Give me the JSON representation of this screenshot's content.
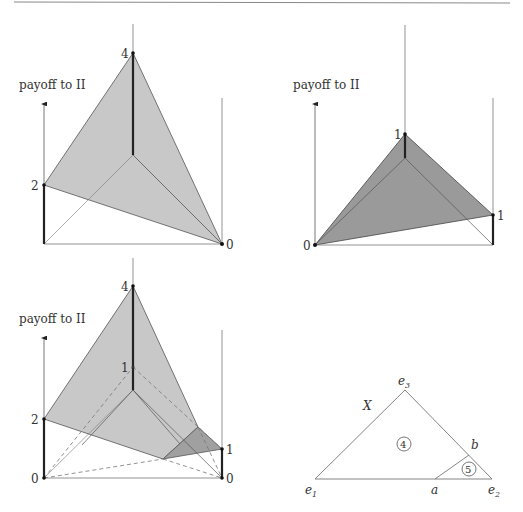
{
  "header_rule": true,
  "panels": [
    {
      "id": "top-left",
      "axis_label": "payoff to II",
      "ticks": {
        "center_top": "4",
        "left": "2",
        "right": "0"
      },
      "fill": "#c8c8c8"
    },
    {
      "id": "top-right",
      "axis_label": "payoff to II",
      "ticks": {
        "center_top": "1",
        "left": "0",
        "right": "1"
      },
      "fill": "#9a9a9a"
    },
    {
      "id": "bottom-left",
      "axis_label": "payoff to II",
      "ticks": {
        "center_top": "4",
        "center_mid": "1",
        "left_top": "2",
        "left_bottom": "0",
        "right_top": "1",
        "right_bottom": "0"
      },
      "fill_light": "#c8c8c8",
      "fill_dark": "#a0a0a0"
    },
    {
      "id": "bottom-right-simplex",
      "vertex_labels": {
        "e1": "e",
        "e1_sub": "1",
        "e2": "e",
        "e2_sub": "2",
        "e3": "e",
        "e3_sub": "3"
      },
      "point_labels": {
        "a": "a",
        "b": "b"
      },
      "set_label": "X",
      "region_labels": [
        "4",
        "5"
      ]
    }
  ]
}
